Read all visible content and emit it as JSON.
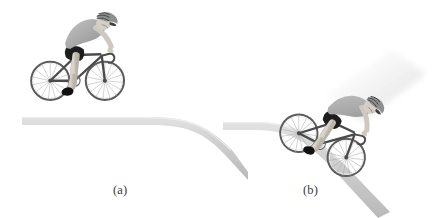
{
  "figure": {
    "type": "physics-textbook-illustration",
    "background_color": "#ffffff",
    "width": 446,
    "height": 218,
    "panels": [
      {
        "id": "a",
        "label": "(a)",
        "label_x": 122,
        "label_y": 190,
        "description": "Cyclist upright on flat road at the top of a hill; road curves downward toward the right",
        "road": {
          "shape": "flat-then-descending",
          "color_top": "#d9d9d9",
          "color_bottom": "#bdbdbd",
          "start_x": 22,
          "flat_y": 118,
          "thickness": 8
        },
        "rider": {
          "pose": "upright-pedaling",
          "rotation_deg": 0,
          "x": 36,
          "y": 6,
          "scale": 1.0,
          "motion_blur": false
        }
      },
      {
        "id": "b",
        "label": "(b)",
        "label_x": 312,
        "label_y": 190,
        "description": "Cyclist leaning forward descending the steep slope, with motion blur streak behind",
        "road": {
          "shape": "flat-then-steep-descent",
          "color_top": "#d9d9d9",
          "color_bottom": "#bdbdbd",
          "start_x": 223,
          "flat_y": 123,
          "thickness": 8
        },
        "rider": {
          "pose": "tucked-descending",
          "rotation_deg": 28,
          "x": 318,
          "y": 62,
          "scale": 0.96,
          "motion_blur": true
        }
      }
    ],
    "palette": {
      "road_light": "#dcdcdc",
      "road_mid": "#cccccc",
      "road_dark": "#b4b4b4",
      "jersey": "#a9a9a9",
      "jersey_shadow": "#8e8e8e",
      "jersey_highlight": "#c4c4c4",
      "shorts": "#1c1c1c",
      "skin": "#d6d2c9",
      "skin_shadow": "#b8b3a8",
      "bike_frame": "#4e4e4e",
      "bike_wheel": "#5a5a5a",
      "spoke": "#9a9a9a",
      "shoe": "#121212",
      "helmet": "#8c8c8c",
      "helmet_dark": "#3d3d3d",
      "blur": "#e4e4e4",
      "label_text": "#3a3a3a"
    }
  }
}
